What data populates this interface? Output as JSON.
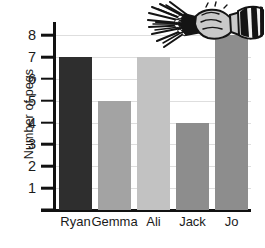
{
  "chart_data": {
    "type": "bar",
    "title": "",
    "subtitle": "",
    "xlabel": "",
    "ylabel": "Number of pegs",
    "categories": [
      "Ryan",
      "Gemma",
      "Ali",
      "Jack",
      "Jo"
    ],
    "values": [
      7,
      5,
      7,
      4,
      8
    ],
    "ylim": [
      0,
      8.6
    ],
    "y_ticks": [
      1,
      2,
      3,
      4,
      5,
      6,
      7,
      8
    ],
    "y_tick_labels": [
      "1",
      "2",
      "3",
      "4",
      "5",
      "6",
      "7",
      "8"
    ],
    "grid": true,
    "grid_axis": "y",
    "legend": false,
    "legend_position": "none",
    "bar_colors": [
      "#2e2e2e",
      "#a3a3a3",
      "#c2c2c2",
      "#8d8d8d",
      "#8d8d8d"
    ],
    "annotations": []
  },
  "axes": {
    "y_title": "Number of pegs",
    "axis_color": "#111111",
    "grid_color": "#dedede",
    "tick_label_color": "#1b1b1b"
  },
  "decoration": {
    "name": "hand-holding-clothes-pegs-illustration",
    "description": "Cartoon hand gripping a bundle of clothes pegs with a striped shirt cuff",
    "peg_color": "#1a1a1a",
    "hand_color": "#c9c9c9",
    "hand_outline": "#1a1a1a",
    "sleeve_stripe_dark": "#1a1a1a",
    "sleeve_stripe_light": "#f2f2f2"
  },
  "canvas": {
    "background": "#ffffff",
    "width": 265,
    "height": 248
  }
}
